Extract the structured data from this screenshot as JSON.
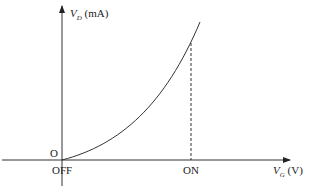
{
  "diagram": {
    "y_axis": {
      "symbol": "V",
      "subscript": "D",
      "unit": "(mA)"
    },
    "x_axis": {
      "symbol": "V",
      "subscript": "G",
      "unit": "(V)"
    },
    "origin_label": "O",
    "x_ticks": [
      "OFF",
      "ON"
    ],
    "curve": "exponential-like rising curve from OFF",
    "dashed_marker": "vertical dashed line at ON"
  }
}
